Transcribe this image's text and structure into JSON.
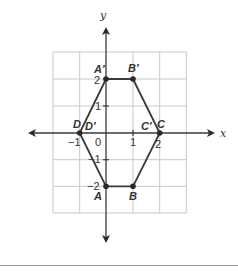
{
  "figure": {
    "title": "",
    "axes": {
      "x_label": "x",
      "y_label": "y",
      "x_range": [
        -2,
        3
      ],
      "y_range": [
        -3,
        3
      ],
      "origin_label": "0",
      "x_ticks": [
        {
          "value": -1,
          "label": "−1"
        },
        {
          "value": 1,
          "label": "1"
        },
        {
          "value": 2,
          "label": "2"
        }
      ],
      "y_ticks": [
        {
          "value": 2,
          "label": "2"
        },
        {
          "value": 1,
          "label": "1"
        },
        {
          "value": -1,
          "label": "−1"
        },
        {
          "value": -2,
          "label": "−2"
        }
      ]
    },
    "points": [
      {
        "name": "A",
        "label": "A",
        "x": 0,
        "y": -2
      },
      {
        "name": "B",
        "label": "B",
        "x": 1,
        "y": -2
      },
      {
        "name": "C",
        "label": "C",
        "x": 2,
        "y": 0
      },
      {
        "name": "D",
        "label": "D",
        "x": -1,
        "y": 0
      },
      {
        "name": "A-prime",
        "label": "A′",
        "x": 0,
        "y": 2
      },
      {
        "name": "B-prime",
        "label": "B′",
        "x": 1,
        "y": 2
      },
      {
        "name": "C-prime",
        "label": "C′",
        "x": 2,
        "y": 0
      },
      {
        "name": "D-prime",
        "label": "D′",
        "x": -1,
        "y": 0
      }
    ],
    "polygons": {
      "original": [
        "A",
        "B",
        "C",
        "D"
      ],
      "image": [
        "A′",
        "B′",
        "C′",
        "D′"
      ],
      "description": "Trapezoid ABCD reflected across the x-axis to A′B′C′D′, forming a hexagon outline"
    },
    "colors": {
      "grid": "#c8c8c8",
      "axes": "#3a3a3a",
      "shape": "#3a3a3a",
      "text": "#333333"
    }
  }
}
